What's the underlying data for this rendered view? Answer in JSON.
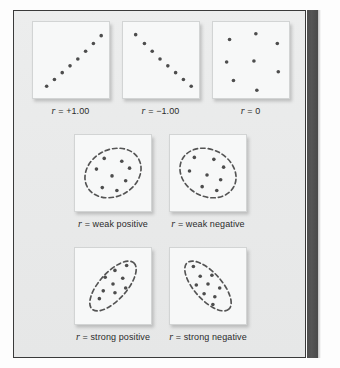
{
  "figure": {
    "background_color": "#e9eaea",
    "frame_color": "#3a3a3a",
    "spine_color": "#4e4e4e",
    "dot_color": "#4d4d4d",
    "ellipse_color": "#545454"
  },
  "panels": [
    {
      "id": "perfect-positive",
      "caption_symbol": "r",
      "caption_text": " = +1.00",
      "pattern": "perfect-positive-line",
      "ellipse": null,
      "points": [
        [
          14,
          66
        ],
        [
          22,
          59
        ],
        [
          30,
          52
        ],
        [
          38,
          45
        ],
        [
          46,
          38
        ],
        [
          54,
          30
        ],
        [
          62,
          22
        ],
        [
          70,
          14
        ]
      ]
    },
    {
      "id": "perfect-negative",
      "caption_symbol": "r",
      "caption_text": " = −1.00",
      "pattern": "perfect-negative-line",
      "ellipse": null,
      "points": [
        [
          13,
          13
        ],
        [
          22,
          22
        ],
        [
          30,
          30
        ],
        [
          38,
          38
        ],
        [
          46,
          45
        ],
        [
          54,
          52
        ],
        [
          62,
          59
        ],
        [
          70,
          66
        ]
      ]
    },
    {
      "id": "zero",
      "caption_symbol": "r",
      "caption_text": " = 0",
      "pattern": "random-scatter",
      "ellipse": null,
      "points": [
        [
          17,
          18
        ],
        [
          44,
          12
        ],
        [
          66,
          22
        ],
        [
          14,
          41
        ],
        [
          42,
          40
        ],
        [
          67,
          51
        ],
        [
          21,
          60
        ],
        [
          45,
          70
        ]
      ]
    },
    {
      "id": "weak-positive",
      "caption_symbol": "r",
      "caption_text": " = weak positive",
      "pattern": "wide-ellipse-positive",
      "ellipse": {
        "cx": 39,
        "cy": 39,
        "rx": 30,
        "ry": 24,
        "rotate": -28
      },
      "points": [
        [
          30,
          24
        ],
        [
          48,
          27
        ],
        [
          56,
          34
        ],
        [
          22,
          35
        ],
        [
          38,
          42
        ],
        [
          52,
          47
        ],
        [
          28,
          54
        ],
        [
          43,
          57
        ]
      ]
    },
    {
      "id": "weak-negative",
      "caption_symbol": "r",
      "caption_text": " = weak negative",
      "pattern": "wide-ellipse-negative",
      "ellipse": {
        "cx": 39,
        "cy": 39,
        "rx": 30,
        "ry": 24,
        "rotate": 28
      },
      "points": [
        [
          25,
          23
        ],
        [
          45,
          25
        ],
        [
          55,
          33
        ],
        [
          20,
          37
        ],
        [
          38,
          41
        ],
        [
          52,
          46
        ],
        [
          33,
          53
        ],
        [
          48,
          57
        ]
      ]
    },
    {
      "id": "strong-positive",
      "caption_symbol": "r",
      "caption_text": " = strong positive",
      "pattern": "narrow-ellipse-positive",
      "ellipse": {
        "cx": 39,
        "cy": 39,
        "rx": 32,
        "ry": 14,
        "rotate": -48
      },
      "points": [
        [
          53,
          18
        ],
        [
          41,
          23
        ],
        [
          31,
          30
        ],
        [
          49,
          31
        ],
        [
          39,
          37
        ],
        [
          52,
          41
        ],
        [
          29,
          44
        ],
        [
          41,
          46
        ],
        [
          25,
          52
        ]
      ]
    },
    {
      "id": "strong-negative",
      "caption_symbol": "r",
      "caption_text": " = strong negative",
      "pattern": "narrow-ellipse-negative",
      "ellipse": {
        "cx": 39,
        "cy": 39,
        "rx": 32,
        "ry": 14,
        "rotate": 48
      },
      "points": [
        [
          24,
          19
        ],
        [
          31,
          29
        ],
        [
          43,
          28
        ],
        [
          27,
          38
        ],
        [
          39,
          37
        ],
        [
          51,
          41
        ],
        [
          35,
          47
        ],
        [
          46,
          50
        ],
        [
          44,
          58
        ]
      ]
    }
  ],
  "chart_data": {
    "type": "scatter",
    "xlabel": "",
    "ylabel": "",
    "grid": false,
    "legend": "none",
    "series": [
      {
        "name": "r = +1.00",
        "r_value": 1.0,
        "description": "perfect positive linear relationship",
        "points": [
          [
            14,
            66
          ],
          [
            22,
            59
          ],
          [
            30,
            52
          ],
          [
            38,
            45
          ],
          [
            46,
            38
          ],
          [
            54,
            30
          ],
          [
            62,
            22
          ],
          [
            70,
            14
          ]
        ]
      },
      {
        "name": "r = −1.00",
        "r_value": -1.0,
        "description": "perfect negative linear relationship",
        "points": [
          [
            13,
            13
          ],
          [
            22,
            22
          ],
          [
            30,
            30
          ],
          [
            38,
            38
          ],
          [
            46,
            45
          ],
          [
            54,
            52
          ],
          [
            62,
            59
          ],
          [
            70,
            66
          ]
        ]
      },
      {
        "name": "r = 0",
        "r_value": 0.0,
        "description": "no relationship, random scatter",
        "points": [
          [
            17,
            18
          ],
          [
            44,
            12
          ],
          [
            66,
            22
          ],
          [
            14,
            41
          ],
          [
            42,
            40
          ],
          [
            67,
            51
          ],
          [
            21,
            60
          ],
          [
            45,
            70
          ]
        ]
      },
      {
        "name": "r = weak positive",
        "r_value": null,
        "description": "broad ellipse tilted upward to the right",
        "points": [
          [
            30,
            24
          ],
          [
            48,
            27
          ],
          [
            56,
            34
          ],
          [
            22,
            35
          ],
          [
            38,
            42
          ],
          [
            52,
            47
          ],
          [
            28,
            54
          ],
          [
            43,
            57
          ]
        ]
      },
      {
        "name": "r = weak negative",
        "r_value": null,
        "description": "broad ellipse tilted downward to the right",
        "points": [
          [
            25,
            23
          ],
          [
            45,
            25
          ],
          [
            55,
            33
          ],
          [
            20,
            37
          ],
          [
            38,
            41
          ],
          [
            52,
            46
          ],
          [
            33,
            53
          ],
          [
            48,
            57
          ]
        ]
      },
      {
        "name": "r = strong positive",
        "r_value": null,
        "description": "narrow ellipse tilted upward to the right",
        "points": [
          [
            53,
            18
          ],
          [
            41,
            23
          ],
          [
            31,
            30
          ],
          [
            49,
            31
          ],
          [
            39,
            37
          ],
          [
            52,
            41
          ],
          [
            29,
            44
          ],
          [
            41,
            46
          ],
          [
            25,
            52
          ]
        ]
      },
      {
        "name": "r = strong negative",
        "r_value": null,
        "description": "narrow ellipse tilted downward to the right",
        "points": [
          [
            24,
            19
          ],
          [
            31,
            29
          ],
          [
            43,
            28
          ],
          [
            27,
            38
          ],
          [
            39,
            37
          ],
          [
            51,
            41
          ],
          [
            35,
            47
          ],
          [
            46,
            50
          ],
          [
            44,
            58
          ]
        ]
      }
    ]
  }
}
